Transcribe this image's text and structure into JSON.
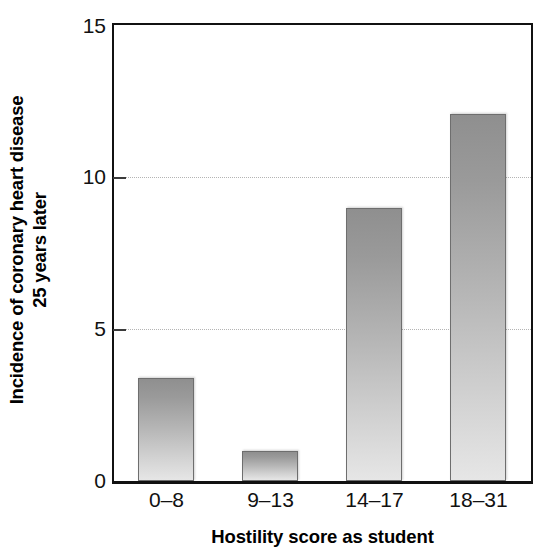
{
  "chart_data": {
    "type": "bar",
    "title": "",
    "subtitle": "",
    "categories": [
      "0–8",
      "9–13",
      "14–17",
      "18–31"
    ],
    "values": [
      3.4,
      1.0,
      9.0,
      12.1
    ],
    "xlabel": "Hostility score as student",
    "ylabel_line1": "Incidence of coronary heart disease",
    "ylabel_line2": "25 years later",
    "ylim": [
      0,
      15
    ],
    "yticks": [
      0,
      5,
      10,
      15
    ],
    "ytick_labels": [
      "0",
      "5",
      "10",
      "15"
    ],
    "gridlines_at": [
      5,
      10
    ],
    "grid": "dotted-horizontal-at-5-and-10",
    "legend": "none",
    "bar_fill": "vertical-gradient-gray",
    "bar_color_top": "#8f8f8f",
    "bar_color_bottom": "#e6e6e6",
    "bar_border_color": "#6e6e6e",
    "axis_color": "#111111",
    "gridline_color": "#b4b4b4",
    "background": "#ffffff"
  }
}
